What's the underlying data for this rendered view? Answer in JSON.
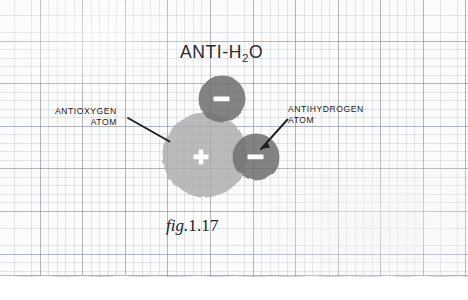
{
  "figure": {
    "title_text": "ANTI-H",
    "title_subscript": "2",
    "title_suffix": "O",
    "caption_prefix": "fig.",
    "caption_number": "1.17",
    "labels": {
      "left_line1": "ANTIOXYGEN",
      "left_line2": "ATOM",
      "right_line1": "ANTIHYDROGEN",
      "right_line2": "ATOM"
    },
    "atoms": [
      {
        "name": "antioxygen-atom",
        "charge_symbol": "+",
        "cx": 205,
        "cy": 155,
        "r": 42,
        "fill": "#b3b3b3"
      },
      {
        "name": "antihydrogen-atom-top",
        "charge_symbol": "−",
        "cx": 222,
        "cy": 99,
        "r": 23,
        "fill": "#7e7e7e"
      },
      {
        "name": "antihydrogen-atom-right",
        "charge_symbol": "−",
        "cx": 256,
        "cy": 157,
        "r": 23,
        "fill": "#7e7e7e"
      }
    ],
    "colors": {
      "paper": "#fbfbfb",
      "grid_major": "#6c7682",
      "grid_minor": "#788491",
      "ink": "#232327",
      "antioxygen_fill": "#b3b3b3",
      "antihydrogen_fill": "#7e7e7e",
      "charge_glyph": "#ffffff"
    },
    "leaders": [
      {
        "name": "leader-line-antioxygen",
        "x1": 128,
        "y1": 118,
        "x2": 169,
        "y2": 141
      },
      {
        "name": "leader-line-antihydrogen",
        "x1": 287,
        "y1": 120,
        "x2": 261,
        "y2": 149
      }
    ]
  }
}
